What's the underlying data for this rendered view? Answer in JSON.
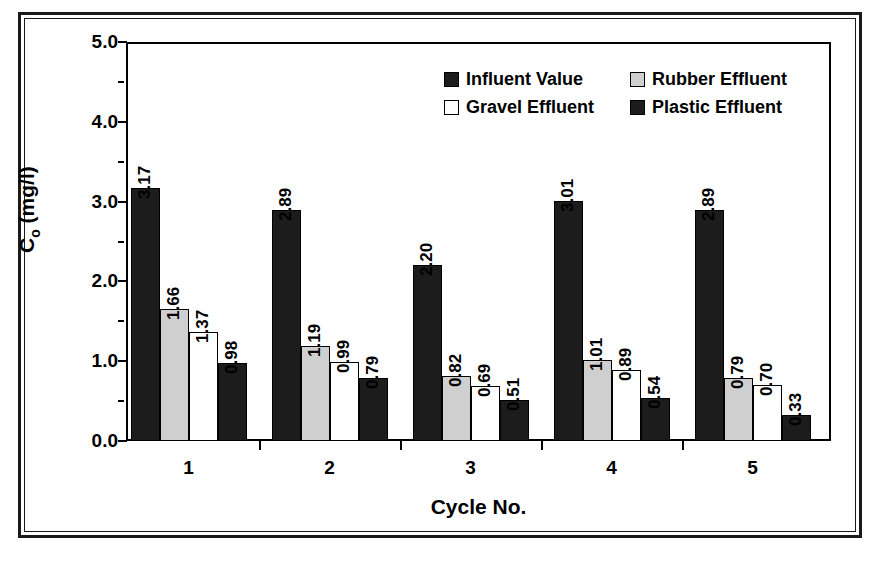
{
  "chart_data": {
    "type": "bar",
    "title": "",
    "xlabel": "Cycle No.",
    "ylabel": "Cₒ (mg/l)",
    "ylabel_base": "C",
    "ylabel_sub": "o",
    "ylabel_unit": " (mg/l)",
    "categories": [
      "1",
      "2",
      "3",
      "4",
      "5"
    ],
    "ylim": [
      0.0,
      5.0
    ],
    "ytick_labels": [
      "0.0",
      "1.0",
      "2.0",
      "3.0",
      "4.0",
      "5.0"
    ],
    "ytick_values": [
      0.0,
      1.0,
      2.0,
      3.0,
      4.0,
      5.0
    ],
    "yminor_values": [
      0.5,
      1.5,
      2.5,
      3.5,
      4.5
    ],
    "grid": false,
    "legend_position": "upper center",
    "series": [
      {
        "name": "Influent Value",
        "key": "influent",
        "color": "#1c1c1c",
        "values": [
          3.17,
          2.89,
          2.2,
          3.01,
          2.89
        ],
        "labels": [
          "3.17",
          "2.89",
          "2.20",
          "3.01",
          "2.89"
        ]
      },
      {
        "name": "Rubber Effluent",
        "key": "rubber",
        "color": "#cfcfcf",
        "values": [
          1.66,
          1.19,
          0.82,
          1.01,
          0.79
        ],
        "labels": [
          "1.66",
          "1.19",
          "0.82",
          "1.01",
          "0.79"
        ]
      },
      {
        "name": "Gravel Effluent",
        "key": "gravel",
        "color": "#ffffff",
        "values": [
          1.37,
          0.99,
          0.69,
          0.89,
          0.7
        ],
        "labels": [
          "1.37",
          "0.99",
          "0.69",
          "0.89",
          "0.70"
        ]
      },
      {
        "name": "Plastic Effluent",
        "key": "plastic",
        "color": "#1c1c1c",
        "values": [
          0.98,
          0.79,
          0.51,
          0.54,
          0.33
        ],
        "labels": [
          "0.98",
          "0.79",
          "0.51",
          "0.54",
          "0.33"
        ]
      }
    ]
  },
  "legend": {
    "items": [
      {
        "label": "Influent Value",
        "key": "influent",
        "row": 0,
        "col": 0
      },
      {
        "label": "Rubber Effluent",
        "key": "rubber",
        "row": 0,
        "col": 1
      },
      {
        "label": "Gravel Effluent",
        "key": "gravel",
        "row": 1,
        "col": 0
      },
      {
        "label": "Plastic Effluent",
        "key": "plastic",
        "row": 1,
        "col": 1
      }
    ]
  },
  "colors": {
    "ink": "#000000",
    "dark_fill": "#1c1c1c",
    "light_fill": "#cfcfcf",
    "white_fill": "#ffffff",
    "frame": "#1a1a1a"
  }
}
